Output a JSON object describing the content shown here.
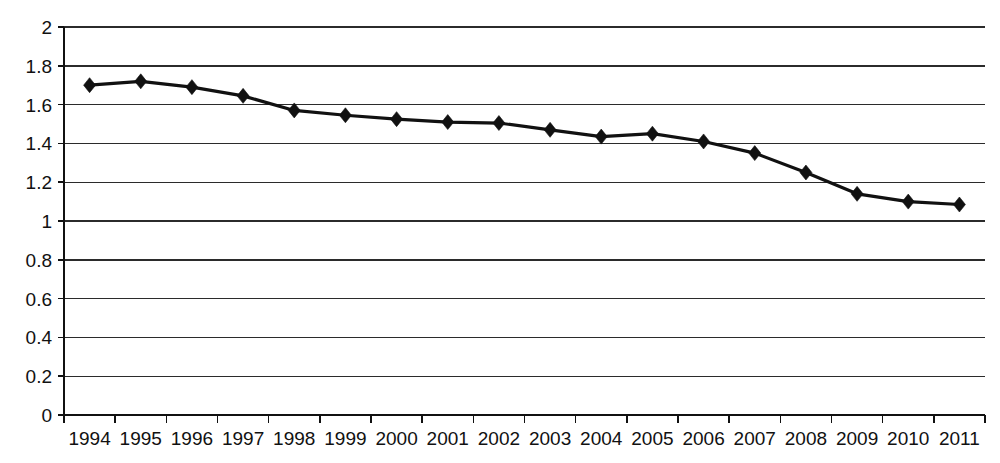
{
  "chart_data": {
    "type": "line",
    "title": "",
    "subtitle": "",
    "xlabel": "",
    "ylabel": "",
    "categories": [
      "1994",
      "1995",
      "1996",
      "1997",
      "1998",
      "1999",
      "2000",
      "2001",
      "2002",
      "2003",
      "2004",
      "2005",
      "2006",
      "2007",
      "2008",
      "2009",
      "2010",
      "2011"
    ],
    "values": [
      1.7,
      1.72,
      1.69,
      1.645,
      1.57,
      1.545,
      1.525,
      1.51,
      1.505,
      1.47,
      1.435,
      1.45,
      1.41,
      1.35,
      1.25,
      1.14,
      1.1,
      1.085
    ],
    "series": [
      {
        "name": "series-1",
        "values": [
          1.7,
          1.72,
          1.69,
          1.645,
          1.57,
          1.545,
          1.525,
          1.51,
          1.505,
          1.47,
          1.435,
          1.45,
          1.41,
          1.35,
          1.25,
          1.14,
          1.1,
          1.085
        ],
        "color": "#111111",
        "marker": "diamond"
      }
    ],
    "ylim": [
      0,
      2
    ],
    "ytick_labels": [
      "0",
      "0.2",
      "0.4",
      "0.6",
      "0.8",
      "1",
      "1.2",
      "1.4",
      "1.6",
      "1.8",
      "2"
    ],
    "ytick_values": [
      0,
      0.2,
      0.4,
      0.6,
      0.8,
      1,
      1.2,
      1.4,
      1.6,
      1.8,
      2
    ],
    "xtick_labels": [
      "1994",
      "1995",
      "1996",
      "1997",
      "1998",
      "1999",
      "2000",
      "2001",
      "2002",
      "2003",
      "2004",
      "2005",
      "2006",
      "2007",
      "2008",
      "2009",
      "2010",
      "2011"
    ],
    "grid": {
      "horizontal": true,
      "vertical": false,
      "color": "#2b2b2b"
    },
    "legend": {
      "visible": false,
      "position": "none",
      "entries": []
    },
    "annotations": [],
    "colors": {
      "line": "#111111",
      "marker": "#111111",
      "grid": "#2b2b2b",
      "axis": "#111111",
      "background": "#ffffff",
      "text": "#111111"
    }
  }
}
